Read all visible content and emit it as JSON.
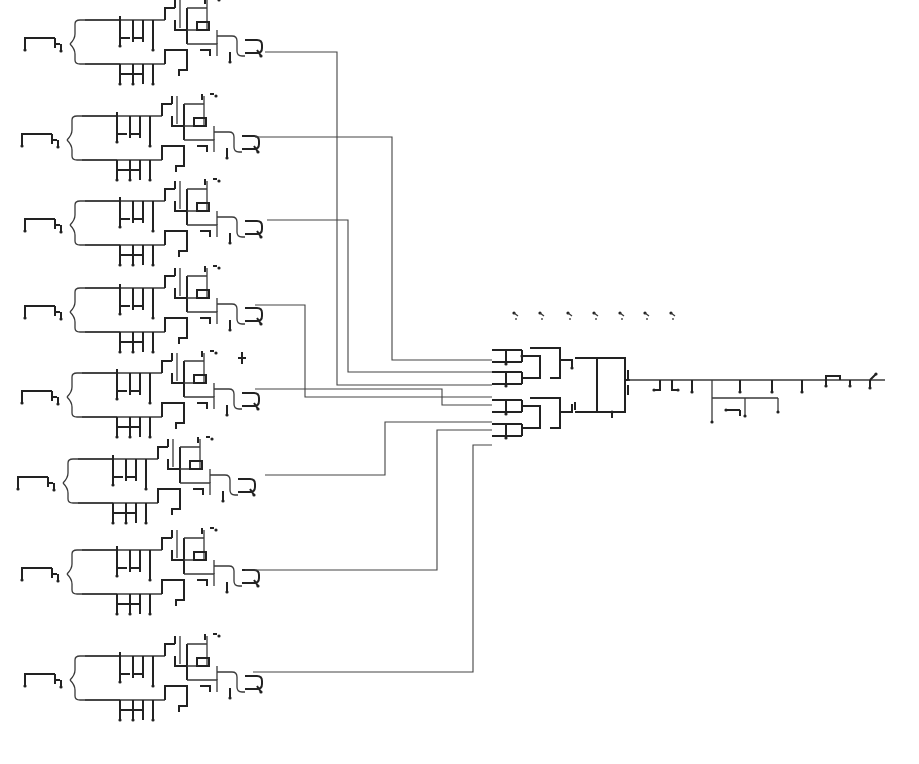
{
  "diagram": {
    "type": "circuit-schematic",
    "background": "#ffffff",
    "wire_color": "#3a3a3a",
    "modules": [
      {
        "id": "stage-1",
        "x": 25,
        "y": 14,
        "out_y": 60
      },
      {
        "id": "stage-2",
        "x": 22,
        "y": 110,
        "out_y": 145
      },
      {
        "id": "stage-3",
        "x": 25,
        "y": 195,
        "out_y": 228
      },
      {
        "id": "stage-4",
        "x": 25,
        "y": 282,
        "out_y": 313
      },
      {
        "id": "stage-5",
        "x": 22,
        "y": 367,
        "out_y": 397
      },
      {
        "id": "stage-6",
        "x": 18,
        "y": 453,
        "out_y": 483
      },
      {
        "id": "stage-7",
        "x": 22,
        "y": 544,
        "out_y": 578
      },
      {
        "id": "stage-8",
        "x": 25,
        "y": 650,
        "out_y": 680
      }
    ],
    "bus_wires": [
      {
        "from_y": 60,
        "from_x": 290,
        "vx": 337,
        "to_y": 385,
        "to_x": 492
      },
      {
        "from_y": 145,
        "from_x": 280,
        "vx": 392,
        "to_y": 360,
        "to_x": 492
      },
      {
        "from_y": 228,
        "from_x": 292,
        "vx": 348,
        "to_y": 372,
        "to_x": 492
      },
      {
        "from_y": 313,
        "from_x": 280,
        "vx": 305,
        "to_y": 397,
        "to_x": 492
      },
      {
        "from_y": 397,
        "from_x": 280,
        "vx": 442,
        "to_y": 405,
        "to_x": 492
      },
      {
        "from_y": 483,
        "from_x": 290,
        "vx": 385,
        "to_y": 422,
        "to_x": 492
      },
      {
        "from_y": 578,
        "from_x": 270,
        "vx": 437,
        "to_y": 430,
        "to_x": 492
      },
      {
        "from_y": 680,
        "from_x": 278,
        "vx": 473,
        "to_y": 445,
        "to_x": 492
      }
    ],
    "floating_symbols": [
      {
        "x": 514,
        "y": 313
      },
      {
        "x": 540,
        "y": 313
      },
      {
        "x": 568,
        "y": 313
      },
      {
        "x": 594,
        "y": 313
      },
      {
        "x": 620,
        "y": 313
      },
      {
        "x": 645,
        "y": 313
      },
      {
        "x": 671,
        "y": 313
      }
    ],
    "output_chain": {
      "start_x": 628,
      "y": 380,
      "end_x": 885
    }
  }
}
